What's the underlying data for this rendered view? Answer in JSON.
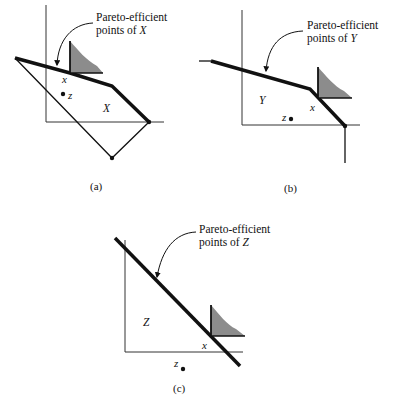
{
  "panels": [
    {
      "id": "a",
      "caption": "(a)",
      "annotation_line1": "Pareto-efficient",
      "annotation_line2_prefix": "points of ",
      "set_name": "X",
      "point_x_label": "x",
      "point_z_label": "z",
      "region_label": "X"
    },
    {
      "id": "b",
      "caption": "(b)",
      "annotation_line1": "Pareto-efficient",
      "annotation_line2_prefix": "points of ",
      "set_name": "Y",
      "point_x_label": "x",
      "point_z_label": "z",
      "region_label": "Y"
    },
    {
      "id": "c",
      "caption": "(c)",
      "annotation_line1": "Pareto-efficient",
      "annotation_line2_prefix": "points of ",
      "set_name": "Z",
      "point_x_label": "x",
      "point_z_label": "z",
      "region_label": "Z"
    }
  ],
  "colors": {
    "line": "#111111",
    "shade": "#8c8c8c",
    "background": "#ffffff"
  }
}
